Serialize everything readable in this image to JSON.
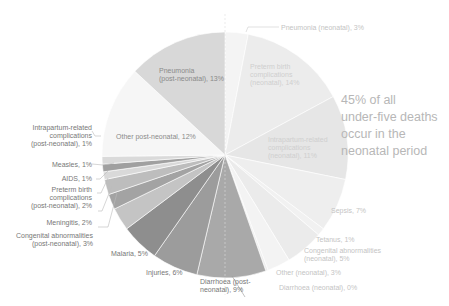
{
  "chart_data": {
    "type": "pie",
    "title": "",
    "start_angle": "12 o'clock",
    "direction": "clockwise",
    "annotation": "45% of all under-five deaths occur in the neonatal period",
    "slices": [
      {
        "label": "Pneumonia (neonatal), 3%",
        "value": 3,
        "group": "neonatal",
        "color": "#f4f4f4"
      },
      {
        "label": "Preterm birth complications (neonatal), 14%",
        "value": 14,
        "group": "neonatal",
        "color": "#ececec"
      },
      {
        "label": "Intrapartum-related complications (neonatal), 11%",
        "value": 11,
        "group": "neonatal",
        "color": "#e6e6e6"
      },
      {
        "label": "Sepsis, 7%",
        "value": 7,
        "group": "neonatal",
        "color": "#eeeeee"
      },
      {
        "label": "Tetanus, 1%",
        "value": 1,
        "group": "neonatal",
        "color": "#f1f1f1"
      },
      {
        "label": "Congenital abnormalities (neonatal), 5%",
        "value": 5,
        "group": "neonatal",
        "color": "#ebebeb"
      },
      {
        "label": "Other (neonatal), 3%",
        "value": 3,
        "group": "neonatal",
        "color": "#f3f3f3"
      },
      {
        "label": "Diarrhoea (neonatal), 0%",
        "value": 0.3,
        "group": "neonatal",
        "color": "#eeeeee"
      },
      {
        "label": "Diarrhoea (post-neonatal), 9%",
        "value": 9,
        "group": "post-neonatal",
        "color": "#a9a9a9"
      },
      {
        "label": "Injuries, 6%",
        "value": 6,
        "group": "post-neonatal",
        "color": "#9c9c9c"
      },
      {
        "label": "Malaria, 5%",
        "value": 5,
        "group": "post-neonatal",
        "color": "#8e8e8e"
      },
      {
        "label": "Congenital abnormalities (post-neonatal), 3%",
        "value": 3,
        "group": "post-neonatal",
        "color": "#c4c4c4"
      },
      {
        "label": "Meningitis, 2%",
        "value": 2,
        "group": "post-neonatal",
        "color": "#a3a3a3"
      },
      {
        "label": "Preterm birth complications (post-neonatal), 2%",
        "value": 2,
        "group": "post-neonatal",
        "color": "#bdbdbd"
      },
      {
        "label": "AIDS, 1%",
        "value": 1,
        "group": "post-neonatal",
        "color": "#d9d9d9"
      },
      {
        "label": "Measles, 1%",
        "value": 1,
        "group": "post-neonatal",
        "color": "#a0a0a0"
      },
      {
        "label": "Intrapartum-related complications (post-neonatal), 1%",
        "value": 1,
        "group": "post-neonatal",
        "color": "#dadada"
      },
      {
        "label": "Other post-neonatal, 12%",
        "value": 12,
        "group": "post-neonatal",
        "color": "#f6f6f6"
      },
      {
        "label": "Pneumonia (post-neonatal), 13%",
        "value": 13,
        "group": "post-neonatal",
        "color": "#d8d8d8"
      }
    ]
  },
  "labels": {
    "pneumonia_neo": "Pneumonia (neonatal), 3%",
    "preterm_neo": "Preterm birth\ncomplications\n(neonatal), 14%",
    "intrapartum_neo": "Intrapartum-related\ncomplications\n(neonatal), 11%",
    "sepsis": "Sepsis, 7%",
    "tetanus": "Tetanus, 1%",
    "congenital_neo": "Congenital abnormalities\n(neonatal), 5%",
    "other_neo": "Other (neonatal), 3%",
    "diarrhoea_neo": "Diarrhoea (neonatal), 0%",
    "diarrhoea_post": "Diarrhoea (post-\nneonatal), 9%",
    "injuries": "Injuries, 6%",
    "malaria": "Malaria, 5%",
    "congenital_post": "Congenital abnormalities\n(post-neonatal), 3%",
    "meningitis": "Meningitis, 2%",
    "preterm_post": "Preterm birth\ncomplications\n(post-neonatal), 2%",
    "aids": "AIDS, 1%",
    "measles": "Measles, 1%",
    "intrapartum_post": "Intrapartum-related\ncomplications\n(post-neonatal), 1%",
    "other_post": "Other post-neonatal, 12%",
    "pneumonia_post": "Pneumonia\n(post-neonatal), 13%"
  },
  "annotation": "45% of all\nunder-five deaths\noccur in the\nneonatal period"
}
